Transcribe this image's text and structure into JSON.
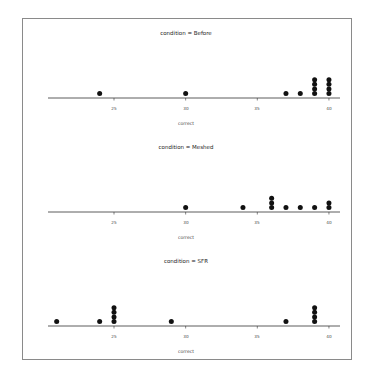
{
  "chart_data": [
    {
      "type": "dot",
      "title": "condition = Before",
      "xlabel": "correct",
      "ylabel": "",
      "xlim": [
        20.5,
        41
      ],
      "xticks": [
        25,
        30,
        35,
        40
      ],
      "x": [
        24,
        30,
        37,
        38,
        39,
        40
      ],
      "counts": [
        1,
        1,
        1,
        1,
        4,
        4
      ]
    },
    {
      "type": "dot",
      "title": "condition = Meshed",
      "xlabel": "correct",
      "ylabel": "",
      "xlim": [
        20.5,
        41
      ],
      "xticks": [
        25,
        30,
        35,
        40
      ],
      "x": [
        30,
        34,
        36,
        37,
        38,
        39,
        40
      ],
      "counts": [
        1,
        1,
        3,
        1,
        1,
        1,
        2
      ]
    },
    {
      "type": "dot",
      "title": "condition = SFR",
      "xlabel": "correct",
      "ylabel": "",
      "xlim": [
        20.5,
        41
      ],
      "xticks": [
        25,
        30,
        35,
        40
      ],
      "x": [
        21,
        24,
        25,
        29,
        37,
        39
      ],
      "counts": [
        1,
        1,
        4,
        1,
        1,
        4
      ]
    }
  ],
  "panels": [
    {
      "title": "condition = Before",
      "xlabel": "correct",
      "ticks": [
        "25",
        "30",
        "35",
        "40"
      ]
    },
    {
      "title": "condition = Meshed",
      "xlabel": "correct",
      "ticks": [
        "25",
        "30",
        "35",
        "40"
      ]
    },
    {
      "title": "condition = SFR",
      "xlabel": "correct",
      "ticks": [
        "25",
        "30",
        "35",
        "40"
      ]
    }
  ],
  "colors": {
    "dot": "#111111",
    "axis": "#333333",
    "frame": "#8a8a8a"
  }
}
